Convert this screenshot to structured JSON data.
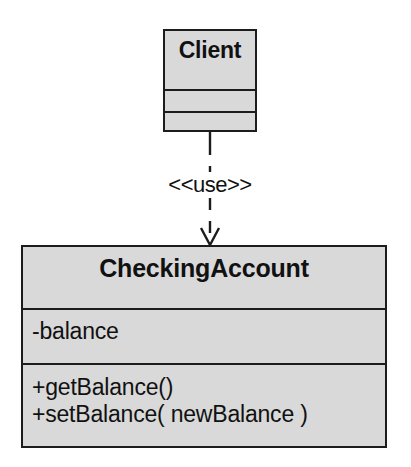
{
  "diagram": {
    "kind": "uml-class-diagram",
    "background_color": "#ffffff",
    "box_fill_color": "#d9d9d9",
    "line_color": "#1c1c1c",
    "text_color": "#111111"
  },
  "classes": [
    {
      "id": "client",
      "name": "Client",
      "attributes": [],
      "operations": []
    },
    {
      "id": "checkingaccount",
      "name": "CheckingAccount",
      "attributes": [
        "-balance"
      ],
      "operations": [
        "+getBalance()",
        "+setBalance( newBalance )"
      ]
    }
  ],
  "relationships": [
    {
      "id": "client-uses-checkingaccount",
      "type": "dependency",
      "stereotype": "<<use>>",
      "source": "Client",
      "target": "CheckingAccount",
      "line_style": "dashed",
      "arrowhead": "open"
    }
  ]
}
